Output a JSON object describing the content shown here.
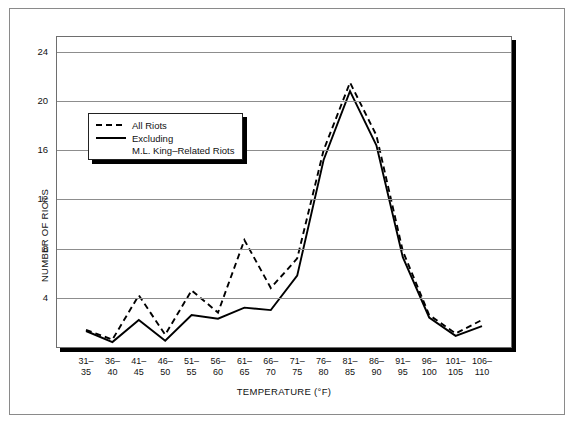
{
  "chart_data": {
    "type": "line",
    "title": "",
    "xlabel": "TEMPERATURE (°F)",
    "ylabel": "NUMBER OF RIOTS",
    "categories": [
      "31–\n35",
      "36–\n40",
      "41–\n45",
      "46–\n50",
      "51–\n55",
      "56–\n60",
      "61–\n65",
      "66–\n70",
      "71–\n75",
      "76–\n80",
      "81–\n85",
      "86–\n90",
      "91–\n95",
      "96–\n100",
      "101–\n105",
      "106–\n110"
    ],
    "category_lines": [
      [
        "31–",
        "35"
      ],
      [
        "36–",
        "40"
      ],
      [
        "41–",
        "45"
      ],
      [
        "46–",
        "50"
      ],
      [
        "51–",
        "55"
      ],
      [
        "56–",
        "60"
      ],
      [
        "61–",
        "65"
      ],
      [
        "66–",
        "70"
      ],
      [
        "71–",
        "75"
      ],
      [
        "76–",
        "80"
      ],
      [
        "81–",
        "85"
      ],
      [
        "86–",
        "90"
      ],
      [
        "91–",
        "95"
      ],
      [
        "96–",
        "100"
      ],
      [
        "101–",
        "105"
      ],
      [
        "106–",
        "110"
      ]
    ],
    "ylim": [
      0,
      25.2
    ],
    "yticks": [
      4,
      8,
      12,
      16,
      20,
      24
    ],
    "ytick_labels": [
      "4",
      "8",
      "12",
      "16",
      "20",
      "24"
    ],
    "grid": true,
    "legend_position": "upper-left-inset",
    "series": [
      {
        "name": "All Riots",
        "style": "dashed",
        "color": "#000000",
        "values": [
          1.4,
          0.6,
          4.2,
          1.0,
          4.6,
          2.8,
          8.7,
          4.8,
          7.2,
          16.0,
          21.5,
          17.2,
          7.8,
          2.6,
          1.1,
          2.2
        ]
      },
      {
        "name": "Excluding M.L. King–Related Riots",
        "style": "solid",
        "color": "#000000",
        "values": [
          1.3,
          0.4,
          2.2,
          0.5,
          2.6,
          2.3,
          3.2,
          3.0,
          5.8,
          15.2,
          20.8,
          16.4,
          7.3,
          2.4,
          0.9,
          1.7
        ]
      }
    ]
  },
  "legend": {
    "entries": [
      {
        "label": "All Riots",
        "style": "dashed"
      },
      {
        "label": "Excluding",
        "style": "solid",
        "sub": "M.L. King–Related Riots"
      }
    ]
  },
  "colors": {
    "line": "#000000",
    "grid": "#8d8d8d",
    "frame": "#8a8a8a",
    "shadow": "#000000",
    "background": "#ffffff"
  }
}
